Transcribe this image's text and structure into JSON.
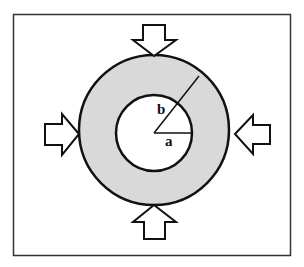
{
  "diagram": {
    "labels": {
      "inner_radius": "a",
      "outer_radius": "b"
    },
    "colors": {
      "ring_fill": "#d9d9d9",
      "stroke": "#111111",
      "background": "#ffffff"
    },
    "arrows": [
      {
        "direction": "down",
        "position": "top"
      },
      {
        "direction": "up",
        "position": "bottom"
      },
      {
        "direction": "right",
        "position": "left"
      },
      {
        "direction": "left",
        "position": "right"
      }
    ]
  }
}
